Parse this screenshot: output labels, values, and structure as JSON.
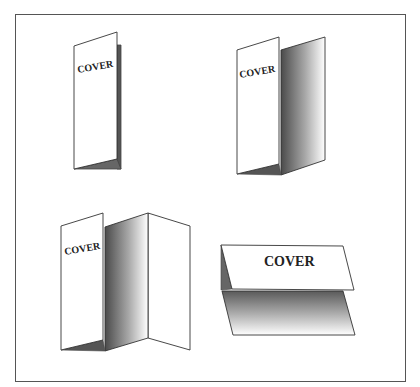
{
  "diagram": {
    "title": "",
    "frame_color": "#555555",
    "stroke_color": "#444444",
    "shadow_dark": "#555555",
    "shadow_light": "#ffffff",
    "figures": [
      {
        "id": "bifold-vertical-closed",
        "cover_label": "COVER",
        "description": "Bi-fold brochure, vertical, slightly open"
      },
      {
        "id": "bifold-vertical-open",
        "cover_label": "COVER",
        "description": "Bi-fold brochure, vertical, opened showing inner panel"
      },
      {
        "id": "trifold-vertical-open",
        "cover_label": "COVER",
        "description": "Tri-fold brochure, vertical, opened showing inner panels"
      },
      {
        "id": "tent-fold-horizontal",
        "cover_label": "COVER",
        "description": "Horizontal tent-fold card with cover on top"
      }
    ]
  }
}
